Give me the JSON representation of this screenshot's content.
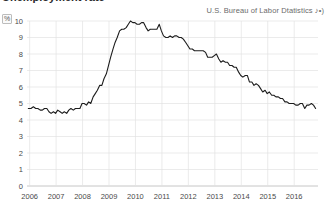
{
  "header": {
    "title_partial": "Unemployment rate",
    "source": "U.S. Bureau of Labor Dtatistics",
    "source_suffix": "♪•)",
    "unit_symbol": "%"
  },
  "chart_data": {
    "type": "line",
    "title": "Unemployment rate",
    "xlabel": "",
    "ylabel": "%",
    "ylim": [
      0,
      10
    ],
    "xlim": [
      2005.9,
      2016.9
    ],
    "grid": true,
    "legend": false,
    "yticks": [
      0,
      1,
      2,
      3,
      4,
      5,
      6,
      7,
      8,
      9,
      10
    ],
    "ytick_labels": [
      "0",
      "1",
      "2",
      "3",
      "4",
      "5",
      "6",
      "7",
      "8",
      "9",
      "10"
    ],
    "xticks": [
      2006,
      2007,
      2008,
      2009,
      2010,
      2011,
      2012,
      2013,
      2014,
      2015,
      2016
    ],
    "xtick_labels": [
      "2006",
      "2007",
      "2008",
      "2009",
      "2010",
      "2011",
      "2012",
      "2013",
      "2014",
      "2015",
      "2016"
    ],
    "series": [
      {
        "name": "Unemployment rate",
        "color": "#1c1c1c",
        "x": [
          2005.95,
          2006.05,
          2006.14,
          2006.23,
          2006.31,
          2006.4,
          2006.48,
          2006.56,
          2006.65,
          2006.73,
          2006.81,
          2006.9,
          2006.98,
          2007.06,
          2007.15,
          2007.23,
          2007.31,
          2007.4,
          2007.48,
          2007.56,
          2007.65,
          2007.73,
          2007.81,
          2007.9,
          2007.98,
          2008.06,
          2008.15,
          2008.23,
          2008.31,
          2008.4,
          2008.48,
          2008.56,
          2008.65,
          2008.73,
          2008.81,
          2008.9,
          2008.98,
          2009.06,
          2009.15,
          2009.23,
          2009.31,
          2009.4,
          2009.48,
          2009.56,
          2009.65,
          2009.73,
          2009.81,
          2009.9,
          2009.98,
          2010.06,
          2010.15,
          2010.23,
          2010.31,
          2010.4,
          2010.48,
          2010.56,
          2010.65,
          2010.73,
          2010.81,
          2010.9,
          2010.98,
          2011.06,
          2011.15,
          2011.23,
          2011.31,
          2011.4,
          2011.48,
          2011.56,
          2011.65,
          2011.73,
          2011.81,
          2011.9,
          2011.98,
          2012.06,
          2012.15,
          2012.23,
          2012.31,
          2012.4,
          2012.48,
          2012.56,
          2012.65,
          2012.73,
          2012.81,
          2012.9,
          2012.98,
          2013.06,
          2013.15,
          2013.23,
          2013.31,
          2013.4,
          2013.48,
          2013.56,
          2013.65,
          2013.73,
          2013.81,
          2013.9,
          2013.98,
          2014.06,
          2014.15,
          2014.23,
          2014.31,
          2014.4,
          2014.48,
          2014.56,
          2014.65,
          2014.73,
          2014.81,
          2014.9,
          2014.98,
          2015.06,
          2015.15,
          2015.23,
          2015.31,
          2015.4,
          2015.48,
          2015.56,
          2015.65,
          2015.73,
          2015.81,
          2015.9,
          2015.98,
          2016.06,
          2016.15,
          2016.23,
          2016.31,
          2016.4,
          2016.48,
          2016.56,
          2016.65,
          2016.73,
          2016.81
        ],
        "values": [
          4.7,
          4.7,
          4.8,
          4.7,
          4.7,
          4.6,
          4.6,
          4.7,
          4.7,
          4.5,
          4.4,
          4.5,
          4.4,
          4.6,
          4.5,
          4.4,
          4.5,
          4.4,
          4.6,
          4.7,
          4.6,
          4.7,
          4.7,
          4.7,
          5.0,
          5.0,
          4.9,
          5.1,
          5.0,
          5.4,
          5.6,
          5.8,
          6.1,
          6.1,
          6.5,
          6.8,
          7.3,
          7.8,
          8.3,
          8.7,
          9.0,
          9.4,
          9.5,
          9.5,
          9.6,
          9.8,
          10.0,
          9.9,
          9.9,
          9.8,
          9.8,
          9.9,
          9.9,
          9.6,
          9.4,
          9.5,
          9.5,
          9.5,
          9.5,
          9.8,
          9.4,
          9.1,
          9.0,
          9.0,
          9.1,
          9.0,
          9.1,
          9.1,
          9.0,
          9.0,
          8.9,
          8.7,
          8.5,
          8.3,
          8.3,
          8.2,
          8.2,
          8.2,
          8.2,
          8.2,
          8.1,
          7.8,
          7.8,
          7.8,
          7.9,
          8.0,
          7.7,
          7.5,
          7.6,
          7.5,
          7.5,
          7.3,
          7.3,
          7.2,
          7.2,
          6.9,
          6.7,
          6.6,
          6.7,
          6.7,
          6.3,
          6.3,
          6.1,
          6.2,
          6.1,
          5.9,
          5.7,
          5.8,
          5.6,
          5.7,
          5.5,
          5.5,
          5.4,
          5.4,
          5.3,
          5.3,
          5.1,
          5.1,
          5.0,
          5.0,
          5.0,
          4.9,
          4.9,
          5.0,
          5.0,
          4.7,
          4.9,
          4.9,
          5.0,
          4.9,
          4.7
        ]
      }
    ]
  }
}
